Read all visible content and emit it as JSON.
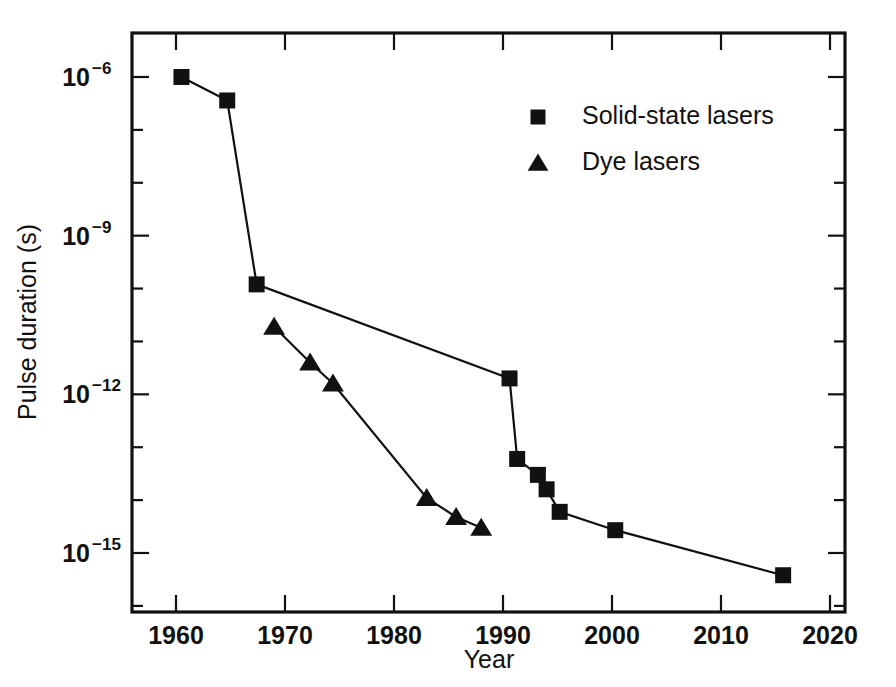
{
  "chart_data": {
    "type": "line",
    "title": "",
    "xlabel": "Year",
    "ylabel": "Pulse duration (s)",
    "xlim": [
      1955,
      2023
    ],
    "ylim": [
      3e-17,
      6e-06
    ],
    "yscale": "log",
    "xscale": "linear",
    "grid": false,
    "legend_position": "upper right",
    "xticks": [
      1960,
      1970,
      1980,
      1990,
      2000,
      2010,
      2020
    ],
    "xticklabels": [
      "1960",
      "1970",
      "1980",
      "1990",
      "2000",
      "2010",
      "2020"
    ],
    "yticks": [
      1e-06,
      1e-09,
      1e-12,
      1e-15
    ],
    "yticklabels": [
      "10⁻⁶",
      "10⁻⁹",
      "10⁻¹²",
      "10⁻¹⁵"
    ],
    "ytick_mantissa": "10",
    "ytick_exponents": [
      "-6",
      "-9",
      "-12",
      "-15"
    ],
    "yminorticks": [
      1e-07,
      1e-08,
      1e-10,
      1e-11,
      1e-13,
      1e-14,
      1e-16
    ],
    "series": [
      {
        "name": "Solid-state lasers",
        "marker": "square",
        "color": "#111111",
        "points": [
          {
            "x": 1960.5,
            "y": 1e-06
          },
          {
            "x": 1964.7,
            "y": 3.6e-07
          },
          {
            "x": 1967.4,
            "y": 1.2e-10
          },
          {
            "x": 1990.6,
            "y": 2e-12
          },
          {
            "x": 1991.3,
            "y": 6e-14
          },
          {
            "x": 1993.2,
            "y": 3e-14
          },
          {
            "x": 1994.0,
            "y": 1.6e-14
          },
          {
            "x": 1995.2,
            "y": 6e-15
          },
          {
            "x": 2000.3,
            "y": 2.7e-15
          },
          {
            "x": 2015.7,
            "y": 3.8e-16
          }
        ]
      },
      {
        "name": "Dye lasers",
        "marker": "triangle",
        "color": "#111111",
        "points": [
          {
            "x": 1969.0,
            "y": 1.9e-11
          },
          {
            "x": 1972.3,
            "y": 4e-12
          },
          {
            "x": 1974.4,
            "y": 1.6e-12
          },
          {
            "x": 1983.0,
            "y": 1.1e-14
          },
          {
            "x": 1985.7,
            "y": 4.8e-15
          },
          {
            "x": 1988.0,
            "y": 3e-15
          }
        ]
      }
    ],
    "legend": [
      {
        "label": "Solid-state lasers",
        "marker": "square"
      },
      {
        "label": "Dye lasers",
        "marker": "triangle"
      }
    ]
  }
}
